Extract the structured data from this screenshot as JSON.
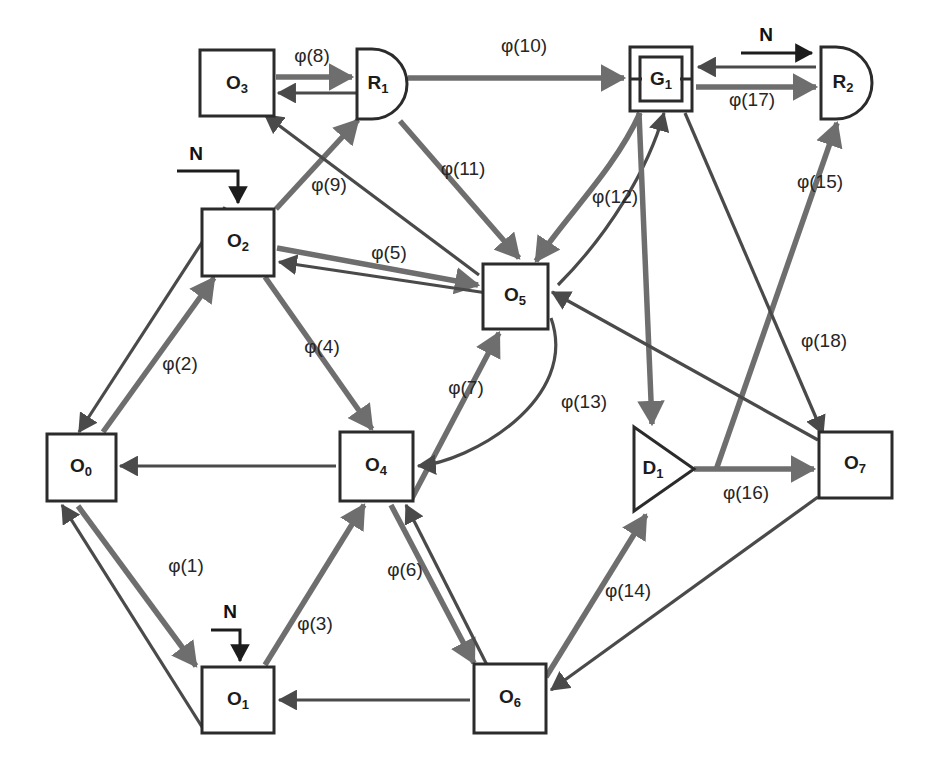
{
  "diagram": {
    "colors": {
      "background": "#ffffff",
      "node_stroke": "#2b2b2b",
      "edge_thick": "#6e6e6e",
      "edge_thin": "#4a4a4a",
      "text": "#1c1c1c"
    },
    "nodes": [
      {
        "id": "O3",
        "base": "O",
        "sub": "3",
        "shape": "rect",
        "x": 200,
        "y": 50,
        "w": 74,
        "h": 66
      },
      {
        "id": "R1",
        "base": "R",
        "sub": "1",
        "shape": "d-shape",
        "x": 357,
        "y": 49,
        "w": 50,
        "h": 70
      },
      {
        "id": "G1",
        "base": "G",
        "sub": "1",
        "shape": "double-rect",
        "x": 630,
        "y": 47,
        "w": 62,
        "h": 64
      },
      {
        "id": "R2",
        "base": "R",
        "sub": "2",
        "shape": "d-shape",
        "x": 821,
        "y": 47,
        "w": 52,
        "h": 72
      },
      {
        "id": "O2",
        "base": "O",
        "sub": "2",
        "shape": "rect",
        "x": 202,
        "y": 209,
        "w": 72,
        "h": 67
      },
      {
        "id": "O5",
        "base": "O",
        "sub": "5",
        "shape": "rect",
        "x": 483,
        "y": 264,
        "w": 65,
        "h": 65
      },
      {
        "id": "O0",
        "base": "O",
        "sub": "0",
        "shape": "rect",
        "x": 47,
        "y": 434,
        "w": 69,
        "h": 67
      },
      {
        "id": "O4",
        "base": "O",
        "sub": "4",
        "shape": "rect",
        "x": 340,
        "y": 432,
        "w": 73,
        "h": 69
      },
      {
        "id": "D1",
        "base": "D",
        "sub": "1",
        "shape": "triangle",
        "x": 634,
        "y": 427,
        "w": 60,
        "h": 84
      },
      {
        "id": "O7",
        "base": "O",
        "sub": "7",
        "shape": "rect",
        "x": 819,
        "y": 432,
        "w": 73,
        "h": 66
      },
      {
        "id": "O1",
        "base": "O",
        "sub": "1",
        "shape": "rect",
        "x": 202,
        "y": 667,
        "w": 72,
        "h": 66
      },
      {
        "id": "O6",
        "base": "O",
        "sub": "6",
        "shape": "rect",
        "x": 474,
        "y": 664,
        "w": 72,
        "h": 69
      }
    ],
    "edge_labels": [
      {
        "id": "phi1",
        "text": "φ(1)",
        "x": 186,
        "y": 567
      },
      {
        "id": "phi2",
        "text": "φ(2)",
        "x": 180,
        "y": 365
      },
      {
        "id": "phi3",
        "text": "φ(3)",
        "x": 315,
        "y": 625
      },
      {
        "id": "phi4",
        "text": "φ(4)",
        "x": 322,
        "y": 348
      },
      {
        "id": "phi5",
        "text": "φ(5)",
        "x": 389,
        "y": 254
      },
      {
        "id": "phi6",
        "text": "φ(6)",
        "x": 405,
        "y": 571
      },
      {
        "id": "phi7",
        "text": "φ(7)",
        "x": 466,
        "y": 389
      },
      {
        "id": "phi8",
        "text": "φ(8)",
        "x": 312,
        "y": 57
      },
      {
        "id": "phi9",
        "text": "φ(9)",
        "x": 329,
        "y": 186
      },
      {
        "id": "phi10",
        "text": "φ(10)",
        "x": 524,
        "y": 47
      },
      {
        "id": "phi11",
        "text": "φ(11)",
        "x": 463,
        "y": 170
      },
      {
        "id": "phi12",
        "text": "φ(12)",
        "x": 615,
        "y": 198
      },
      {
        "id": "phi13",
        "text": "φ(13)",
        "x": 584,
        "y": 403
      },
      {
        "id": "phi14",
        "text": "φ(14)",
        "x": 628,
        "y": 592
      },
      {
        "id": "phi15",
        "text": "φ(15)",
        "x": 820,
        "y": 183
      },
      {
        "id": "phi16",
        "text": "φ(16)",
        "x": 746,
        "y": 494
      },
      {
        "id": "phi17",
        "text": "φ(17)",
        "x": 752,
        "y": 101
      },
      {
        "id": "phi18",
        "text": "φ(18)",
        "x": 824,
        "y": 342
      }
    ],
    "n_inputs": [
      {
        "id": "n-o2",
        "text": "N",
        "label_x": 196,
        "label_y": 155,
        "path": "M 177 171 L 238 171 L 238 205",
        "target": "O2"
      },
      {
        "id": "n-o1",
        "text": "N",
        "label_x": 230,
        "label_y": 613,
        "path": "M 211 630 L 240 630 L 240 663",
        "target": "O1"
      },
      {
        "id": "n-r2",
        "text": "N",
        "label_x": 766,
        "label_y": 36,
        "path": "M 741 53 L 816 53",
        "target": "R2"
      }
    ]
  }
}
